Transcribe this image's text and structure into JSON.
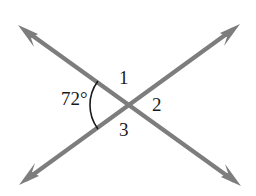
{
  "figure": {
    "background_color": "#ffffff",
    "line_color": "#7d7d7d",
    "arc_color": "#1a1a1a",
    "text_color": "#1a1a1a"
  },
  "labels": {
    "angle_measure": "72°",
    "angle_1": "1",
    "angle_2": "2",
    "angle_3": "3"
  },
  "geometry": {
    "intersection": {
      "x": 130,
      "y": 105
    },
    "lines": [
      {
        "name": "line-up-right",
        "from": {
          "x": 20,
          "y": 185
        },
        "to": {
          "x": 239,
          "y": 24
        },
        "arrow_start": true,
        "arrow_end": true
      },
      {
        "name": "line-down-right",
        "from": {
          "x": 19,
          "y": 25
        },
        "to": {
          "x": 240,
          "y": 186
        },
        "arrow_start": true,
        "arrow_end": true
      }
    ],
    "arc": {
      "name": "angle-arc-72",
      "center": {
        "x": 130,
        "y": 105
      },
      "radius": 40,
      "start_angle_deg": 144,
      "end_angle_deg": 216
    }
  }
}
